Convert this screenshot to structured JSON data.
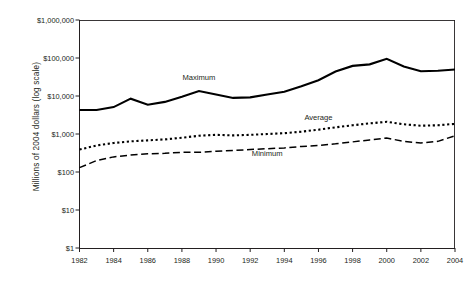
{
  "chart_data": {
    "type": "line",
    "title": "",
    "xlabel": "",
    "ylabel": "Millions of 2004 dollars (log scale)",
    "scale": "log",
    "grid": false,
    "legend_position": "inline-annotation",
    "x": [
      1982,
      1983,
      1984,
      1985,
      1986,
      1987,
      1988,
      1989,
      1990,
      1991,
      1992,
      1993,
      1994,
      1995,
      1996,
      1997,
      1998,
      1999,
      2000,
      2001,
      2002,
      2003,
      2004
    ],
    "xlim": [
      1982,
      2004
    ],
    "ylim": [
      1,
      1000000
    ],
    "y_tick_labels": [
      "$1,000,000",
      "$100,000",
      "$10,000",
      "$1,000",
      "$100",
      "$10",
      "$1"
    ],
    "y_tick_values": [
      1000000,
      100000,
      10000,
      1000,
      100,
      10,
      1
    ],
    "x_tick_labels": [
      "1982",
      "1984",
      "1986",
      "1988",
      "1990",
      "1992",
      "1994",
      "1996",
      "1998",
      "2000",
      "2002",
      "2004"
    ],
    "x_tick_values": [
      1982,
      1984,
      1986,
      1988,
      1990,
      1992,
      1994,
      1996,
      1998,
      2000,
      2002,
      2004
    ],
    "series": [
      {
        "name": "Maximum",
        "style": "solid",
        "color": "#000000",
        "label_x": 1989,
        "label_y": 30000,
        "values": [
          4300,
          4300,
          5100,
          8500,
          5900,
          7000,
          9500,
          13500,
          11000,
          8900,
          9200,
          11000,
          13000,
          18000,
          26000,
          44000,
          62000,
          68000,
          95000,
          60000,
          45000,
          46000,
          50000
        ]
      },
      {
        "name": "Average",
        "style": "dotted",
        "color": "#000000",
        "label_x": 1996,
        "label_y": 2700,
        "values": [
          390,
          500,
          580,
          640,
          680,
          720,
          800,
          900,
          950,
          920,
          950,
          1000,
          1050,
          1150,
          1300,
          1500,
          1700,
          1900,
          2100,
          1800,
          1650,
          1700,
          1850
        ]
      },
      {
        "name": "Minimum",
        "style": "dashed",
        "color": "#000000",
        "label_x": 1993,
        "label_y": 300,
        "values": [
          130,
          200,
          250,
          280,
          300,
          310,
          330,
          330,
          350,
          370,
          390,
          410,
          430,
          470,
          500,
          550,
          620,
          700,
          780,
          640,
          580,
          640,
          900
        ]
      }
    ]
  }
}
